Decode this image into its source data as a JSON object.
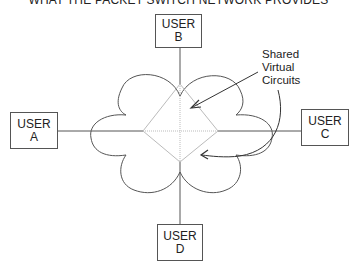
{
  "title": "WHAT THE PACKET SWITCH NETWORK PROVIDES",
  "users": [
    {
      "id": "A",
      "line1": "USER",
      "line2": "A"
    },
    {
      "id": "B",
      "line1": "USER",
      "line2": "B"
    },
    {
      "id": "C",
      "line1": "USER",
      "line2": "C"
    },
    {
      "id": "D",
      "line1": "USER",
      "line2": "D"
    }
  ],
  "annotation": {
    "line1": "Shared",
    "line2": "Virtual",
    "line3": "Circuits"
  },
  "colors": {
    "line": "#555555",
    "diamond": "#bbbbbb",
    "text": "#222222"
  }
}
